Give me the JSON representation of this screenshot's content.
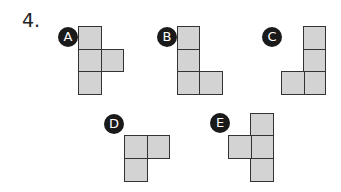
{
  "question": {
    "number": "4."
  },
  "options": [
    {
      "label": "A",
      "badge": {
        "cx": 68,
        "cy": 37
      },
      "cells": [
        [
          78,
          26
        ],
        [
          78,
          48.7
        ],
        [
          100.7,
          48.7
        ],
        [
          78,
          71.3
        ]
      ]
    },
    {
      "label": "B",
      "badge": {
        "cx": 167,
        "cy": 37
      },
      "cells": [
        [
          176.7,
          26
        ],
        [
          176.7,
          48.7
        ],
        [
          176.7,
          71.3
        ],
        [
          199.3,
          71.3
        ]
      ]
    },
    {
      "label": "C",
      "badge": {
        "cx": 272,
        "cy": 37
      },
      "cells": [
        [
          302.7,
          26
        ],
        [
          302.7,
          48.7
        ],
        [
          302.7,
          71.3
        ],
        [
          281,
          71.3
        ]
      ]
    },
    {
      "label": "D",
      "badge": {
        "cx": 114,
        "cy": 124
      },
      "cells": [
        [
          124.3,
          135.3
        ],
        [
          146.7,
          135.3
        ],
        [
          124.3,
          158.3
        ]
      ]
    },
    {
      "label": "E",
      "badge": {
        "cx": 220,
        "cy": 123
      },
      "cells": [
        [
          250.3,
          112.7
        ],
        [
          250.3,
          135.3
        ],
        [
          228,
          135.3
        ],
        [
          250.3,
          158.3
        ]
      ]
    }
  ],
  "cell_size": 22.7,
  "colors": {
    "cell_fill": "#d3d3d3",
    "cell_border": "#333333",
    "badge": "#1a1a1a"
  }
}
